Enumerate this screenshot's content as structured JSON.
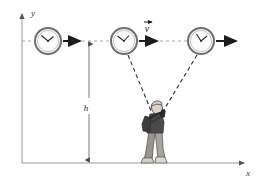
{
  "figure": {
    "background_color": "#fefefe",
    "line_color": "#8a8a8a",
    "dark_color": "#1c1c1c"
  },
  "axes": {
    "y_label": "y",
    "x_label": "x",
    "color": "#9a9a9a",
    "origin": {
      "x": 22,
      "y": 163
    },
    "y_top": 10,
    "x_right": 248
  },
  "labels": {
    "height_label": "h",
    "velocity_label": "v",
    "velocity_vector_accent": "→"
  },
  "clocks": [
    {
      "name": "clock-left",
      "cx": 48,
      "cy": 41,
      "r": 13,
      "hour_angle_deg": -60,
      "minute_angle_deg": -150,
      "face_color": "#fbfbfb",
      "rim_color": "#6f6f6f"
    },
    {
      "name": "clock-middle",
      "cx": 124,
      "cy": 41,
      "r": 13,
      "hour_angle_deg": -55,
      "minute_angle_deg": -160,
      "face_color": "#fbfbfb",
      "rim_color": "#6f6f6f"
    },
    {
      "name": "clock-right",
      "cx": 201,
      "cy": 41,
      "r": 13,
      "hour_angle_deg": -40,
      "minute_angle_deg": -105,
      "face_color": "#fbfbfb",
      "rim_color": "#6f6f6f"
    }
  ],
  "motion_arrows": [
    {
      "name": "motion-arrow-left",
      "x1": 63,
      "y1": 41,
      "x2": 84,
      "y2": 41
    },
    {
      "name": "motion-arrow-middle",
      "x1": 139,
      "y1": 41,
      "x2": 160,
      "y2": 41
    },
    {
      "name": "motion-arrow-right",
      "x1": 216,
      "y1": 41,
      "x2": 239,
      "y2": 41
    }
  ],
  "guide_line": {
    "name": "horizontal-dashed-guide",
    "y": 41,
    "x_start": 22,
    "x_end": 205,
    "dash": "3 3",
    "color": "#a8a8a8"
  },
  "light_rays": [
    {
      "name": "light-ray-from-middle-clock",
      "x1": 128,
      "y1": 55,
      "x2": 152,
      "y2": 112
    },
    {
      "name": "light-ray-from-right-clock",
      "x1": 197,
      "y1": 55,
      "x2": 161,
      "y2": 112
    }
  ],
  "height_dimension": {
    "name": "height-dimension-line",
    "x": 89,
    "y_top": 41,
    "y_bottom": 163,
    "label_x": 89,
    "label_y": 107
  },
  "observer": {
    "name": "observer-figure",
    "ground_y": 163,
    "colors": {
      "skin": "#dcd4c8",
      "shirt": "#4a4a4a",
      "backpack": "#3c3c3c",
      "pants": "#9a968e",
      "shoes": "#cfcbc3",
      "outline": "#2b2b2b",
      "hair": "#cfc9bf"
    }
  }
}
